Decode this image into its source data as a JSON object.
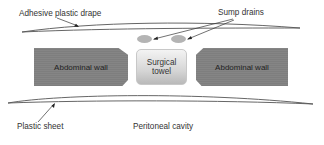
{
  "diagram": {
    "type": "anatomical cross-section schematic",
    "labels": {
      "adhesive_drape": "Adhesive plastic drape",
      "sump_drains": "Sump drains",
      "plastic_sheet": "Plastic sheet",
      "peritoneal_cavity": "Peritoneal cavity"
    },
    "blocks": {
      "abdominal_wall_left": "Abdominal wall",
      "abdominal_wall_right": "Abdominal wall",
      "surgical_towel_line1": "Surgical",
      "surgical_towel_line2": "towel"
    },
    "elements": [
      {
        "name": "Adhesive plastic drape",
        "shape": "thin lens curve",
        "position": "top"
      },
      {
        "name": "Sump drains",
        "shape": "two grey ovals",
        "count": 2,
        "position": "below drape, above towel"
      },
      {
        "name": "Abdominal wall",
        "shape": "dark grey block",
        "count": 2,
        "position": "left and right"
      },
      {
        "name": "Surgical towel",
        "shape": "light grey rounded square",
        "position": "center"
      },
      {
        "name": "Plastic sheet",
        "shape": "thin lens curve",
        "position": "below walls"
      },
      {
        "name": "Peritoneal cavity",
        "shape": "text region",
        "position": "bottom"
      }
    ],
    "colors": {
      "wall": "#858585",
      "towel": "#d6d6d6",
      "drain": "#b4b4b4",
      "line": "#555555",
      "text": "#333333"
    }
  }
}
